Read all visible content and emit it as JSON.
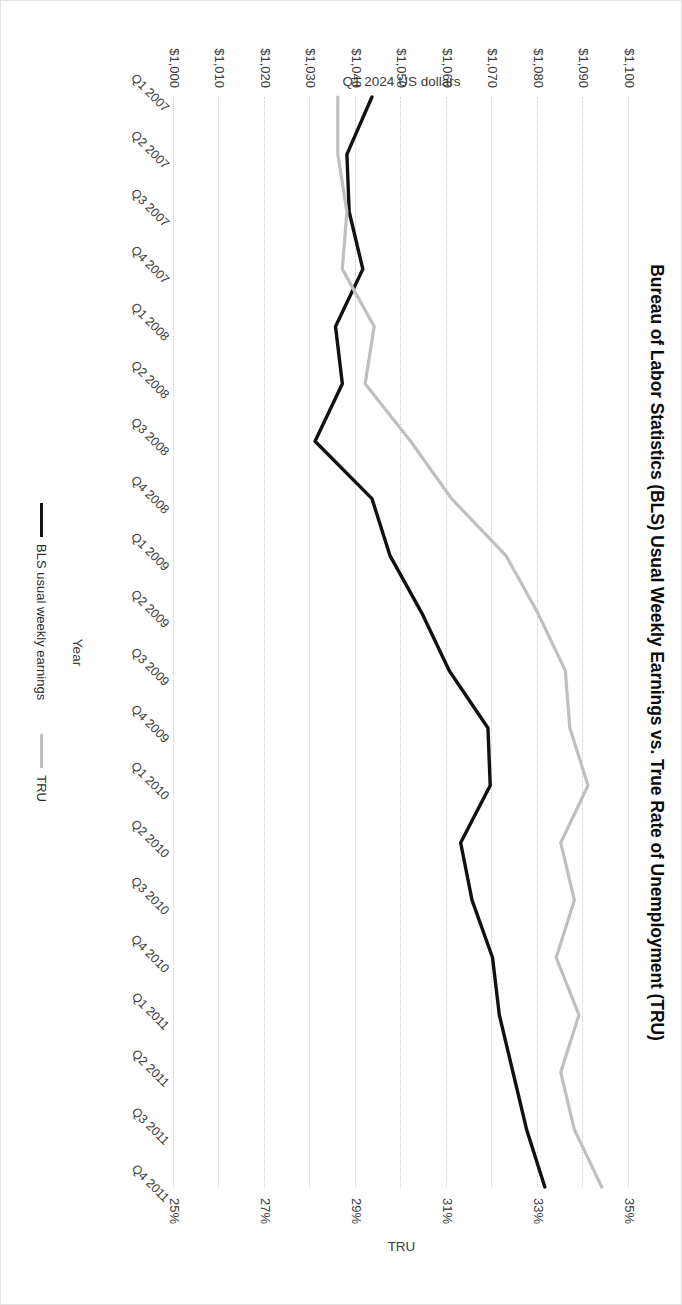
{
  "chart_data": {
    "type": "line",
    "title": "Bureau of Labor Statistics (BLS) Usual Weekly Earnings vs. True Rate of Unemployment (TRU)",
    "xlabel": "Year",
    "ylabel": "Q1 2024 US dollars",
    "y2label": "TRU",
    "grid": true,
    "legend_position": "bottom",
    "categories": [
      "Q1 2007",
      "Q2 2007",
      "Q3 2007",
      "Q4 2007",
      "Q1 2008",
      "Q2 2008",
      "Q3 2008",
      "Q4 2008",
      "Q1 2009",
      "Q2 2009",
      "Q3 2009",
      "Q4 2009",
      "Q1 2010",
      "Q2 2010",
      "Q3 2010",
      "Q4 2010",
      "Q1 2011",
      "Q2 2011",
      "Q3 2011",
      "Q4 2011"
    ],
    "ylim": [
      1000,
      1100
    ],
    "yticks": [
      "$1,000",
      "$1,010",
      "$1,020",
      "$1,030",
      "$1,040",
      "$1,050",
      "$1,060",
      "$1,070",
      "$1,080",
      "$1,090",
      "$1,100"
    ],
    "ytick_values": [
      1000,
      1010,
      1020,
      1030,
      1040,
      1050,
      1060,
      1070,
      1080,
      1090,
      1100
    ],
    "y2lim": [
      25,
      35
    ],
    "y2ticks": [
      "25%",
      "27%",
      "29%",
      "31%",
      "33%",
      "35%"
    ],
    "y2tick_values": [
      25,
      27,
      29,
      31,
      33,
      35
    ],
    "series": [
      {
        "name": "BLS usual weekly earnings",
        "axis": "left",
        "color": "#111111",
        "values": [
          1043.5,
          1038.0,
          1038.5,
          1041.5,
          1035.5,
          1037.0,
          1031.0,
          1043.5,
          1047.5,
          1054.5,
          1060.5,
          1069.0,
          1069.5,
          1063.0,
          1065.5,
          1070.0,
          1071.5,
          1074.5,
          1077.5,
          1081.5
        ]
      },
      {
        "name": "TRU",
        "axis": "right",
        "color": "#bfbfbf",
        "values": [
          28.6,
          28.6,
          28.8,
          28.7,
          29.4,
          29.2,
          30.2,
          31.1,
          32.3,
          33.0,
          33.6,
          33.7,
          34.1,
          33.5,
          33.8,
          33.4,
          33.9,
          33.5,
          33.8,
          34.4
        ]
      }
    ]
  }
}
